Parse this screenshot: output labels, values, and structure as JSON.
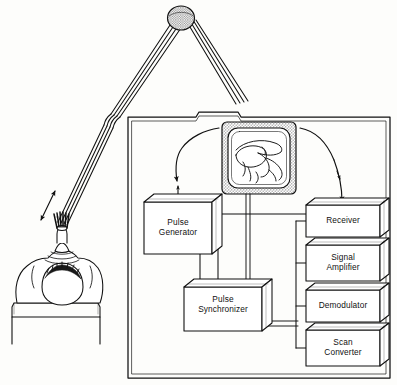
{
  "figure": {
    "background_color": "#fdfdfb",
    "line_color": "#111111",
    "style": "line-art technical illustration"
  },
  "console": {
    "name": "scanner console cabinet",
    "border_style": "double-line rectangle"
  },
  "display": {
    "name": "display monitor",
    "bezel": "stippled gray",
    "screen_content": "ultrasound sector scan of anatomy"
  },
  "patient": {
    "name": "patient head on examination table",
    "transducer": "hatched probe on scalp"
  },
  "arm": {
    "name": "articulated scanning arm",
    "joint": "stippled pivot joint",
    "motion_arrow": "double-headed arrow along arm"
  },
  "blocks": [
    {
      "id": "pulse-generator",
      "label": "Pulse\nGenerator",
      "x": 144,
      "y": 202,
      "w": 68,
      "h": 52
    },
    {
      "id": "pulse-synchronizer",
      "label": "Pulse\nSynchronizer",
      "x": 184,
      "y": 287,
      "w": 78,
      "h": 44
    },
    {
      "id": "receiver",
      "label": "Receiver",
      "x": 306,
      "y": 205,
      "w": 74,
      "h": 32
    },
    {
      "id": "signal-amplifier",
      "label": "Signal\nAmplifier",
      "x": 306,
      "y": 245,
      "w": 74,
      "h": 36
    },
    {
      "id": "demodulator",
      "label": "Demodulator",
      "x": 306,
      "y": 290,
      "w": 74,
      "h": 32
    },
    {
      "id": "scan-converter",
      "label": "Scan\nConverter",
      "x": 306,
      "y": 330,
      "w": 74,
      "h": 36
    }
  ],
  "signal_paths": {
    "transmit": "Pulse Generator to transducer",
    "receive": "transducer to Receiver",
    "bus": "vertical bus linking Receiver, Signal Amplifier, Demodulator, Scan Converter",
    "video": "Scan Converter to display monitor"
  }
}
